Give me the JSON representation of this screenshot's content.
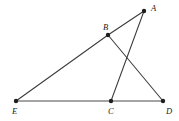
{
  "figure": {
    "canvas": {
      "width": 179,
      "height": 121
    },
    "background_color": "#ffffff",
    "line_color": "#3b3b3b",
    "label_color": "#1a1a1a",
    "vertex_color": "#1e1e1e"
  },
  "points": {
    "A": {
      "name": "A",
      "label": "A",
      "x": 144,
      "y": 11,
      "label_x": 151,
      "label_y": 4
    },
    "B": {
      "name": "B",
      "label": "B",
      "x": 108,
      "y": 35,
      "label_x": 103,
      "label_y": 23
    },
    "C": {
      "name": "C",
      "label": "C",
      "x": 111,
      "y": 101,
      "label_x": 108,
      "label_y": 107
    },
    "D": {
      "name": "D",
      "label": "D",
      "x": 163,
      "y": 101,
      "label_x": 166,
      "label_y": 107
    },
    "E": {
      "name": "E",
      "label": "E",
      "x": 16,
      "y": 101,
      "label_x": 12,
      "label_y": 107
    }
  },
  "segments": [
    {
      "name": "segment-EB",
      "from": "E",
      "to": "B",
      "style": "solid"
    },
    {
      "name": "segment-BA",
      "from": "B",
      "to": "A",
      "style": "solid"
    },
    {
      "name": "segment-BD",
      "from": "B",
      "to": "D",
      "style": "solid"
    },
    {
      "name": "segment-AC",
      "from": "A",
      "to": "C",
      "style": "solid"
    },
    {
      "name": "segment-EC",
      "from": "E",
      "to": "C",
      "style": "solid"
    },
    {
      "name": "segment-CD",
      "from": "C",
      "to": "D",
      "style": "solid"
    }
  ],
  "labels": {
    "A": "A",
    "B": "B",
    "C": "C",
    "D": "D",
    "E": "E"
  }
}
